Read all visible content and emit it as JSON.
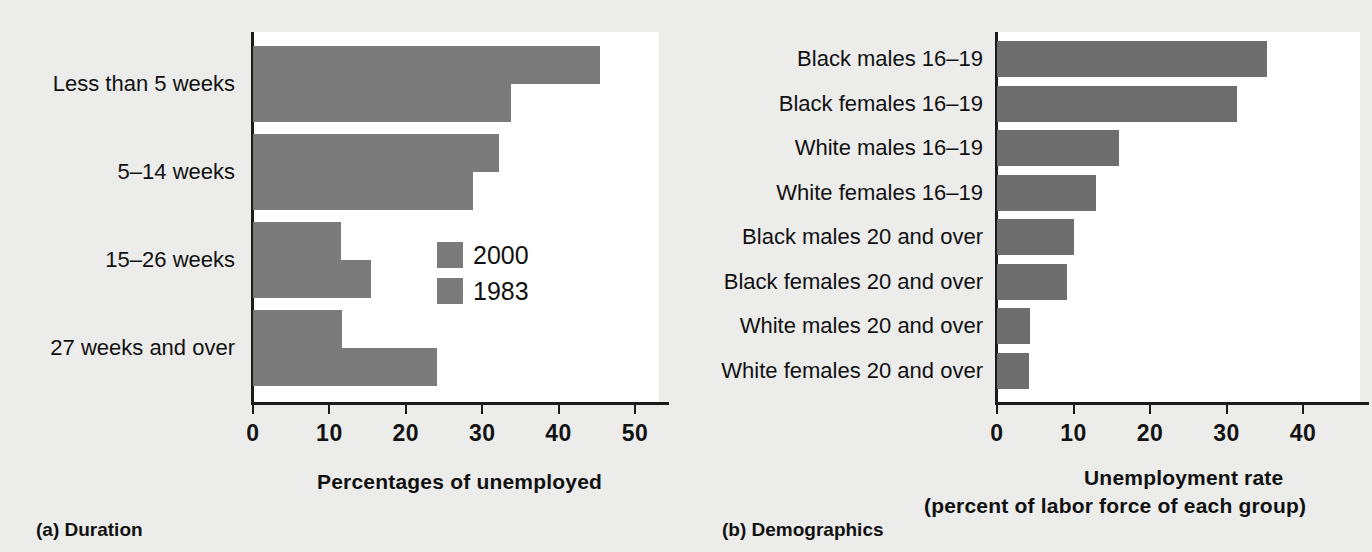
{
  "figure": {
    "background_color": "#ececeb",
    "bar_color": "#7b7b7b",
    "plot_background": "#ffffff",
    "axis_color": "#1b1b1b"
  },
  "panel_a": {
    "caption": "(a) Duration",
    "xlabel": "Percentages of unemployed",
    "legend": [
      {
        "label": "2000",
        "color": "#7b7b7b"
      },
      {
        "label": "1983",
        "color": "#7b7b7b"
      }
    ],
    "ticks": [
      "0",
      "10",
      "20",
      "30",
      "40",
      "50"
    ],
    "tick_values": [
      0,
      10,
      20,
      30,
      40,
      50
    ],
    "categories": [
      "Less than 5 weeks",
      "5–14 weeks",
      "15–26 weeks",
      "27 weeks and over"
    ],
    "series": [
      {
        "name": "2000",
        "values": [
          45.4,
          32.2,
          11.5,
          11.7
        ]
      },
      {
        "name": "1983",
        "values": [
          33.8,
          28.8,
          15.5,
          24.1
        ]
      }
    ]
  },
  "panel_b": {
    "caption": "(b) Demographics",
    "xlabel_line1": "Unemployment rate",
    "xlabel_line2": "(percent of labor force of each group)",
    "ticks": [
      "0",
      "10",
      "20",
      "30",
      "40"
    ],
    "tick_values": [
      0,
      10,
      20,
      30,
      40
    ],
    "categories": [
      "Black males 16–19",
      "Black females 16–19",
      "White males 16–19",
      "White females 16–19",
      "Black males 20 and over",
      "Black females 20 and over",
      "White males 20 and over",
      "White females 20 and over"
    ],
    "values": [
      35.3,
      31.4,
      16.0,
      12.9,
      10.0,
      9.2,
      4.3,
      4.2
    ]
  },
  "chart_data": [
    {
      "type": "bar",
      "orientation": "horizontal",
      "title": "(a) Duration",
      "xlabel": "Percentages of unemployed",
      "ylabel": "",
      "xlim": [
        0,
        53
      ],
      "xticks": [
        0,
        10,
        20,
        30,
        40,
        50
      ],
      "grid": false,
      "legend_position": "inside-right",
      "categories": [
        "Less than 5 weeks",
        "5–14 weeks",
        "15–26 weeks",
        "27 weeks and over"
      ],
      "series": [
        {
          "name": "2000",
          "values": [
            45.4,
            32.2,
            11.5,
            11.7
          ]
        },
        {
          "name": "1983",
          "values": [
            33.8,
            28.8,
            15.5,
            24.1
          ]
        }
      ]
    },
    {
      "type": "bar",
      "orientation": "horizontal",
      "title": "(b) Demographics",
      "xlabel": "Unemployment rate (percent of labor force of each group)",
      "ylabel": "",
      "xlim": [
        0,
        43
      ],
      "xticks": [
        0,
        10,
        20,
        30,
        40
      ],
      "grid": false,
      "legend_position": "none",
      "categories": [
        "Black males 16–19",
        "Black females 16–19",
        "White males 16–19",
        "White females 16–19",
        "Black males 20 and over",
        "Black females 20 and over",
        "White males 20 and over",
        "White females 20 and over"
      ],
      "values": [
        35.3,
        31.4,
        16.0,
        12.9,
        10.0,
        9.2,
        4.3,
        4.2
      ]
    }
  ]
}
